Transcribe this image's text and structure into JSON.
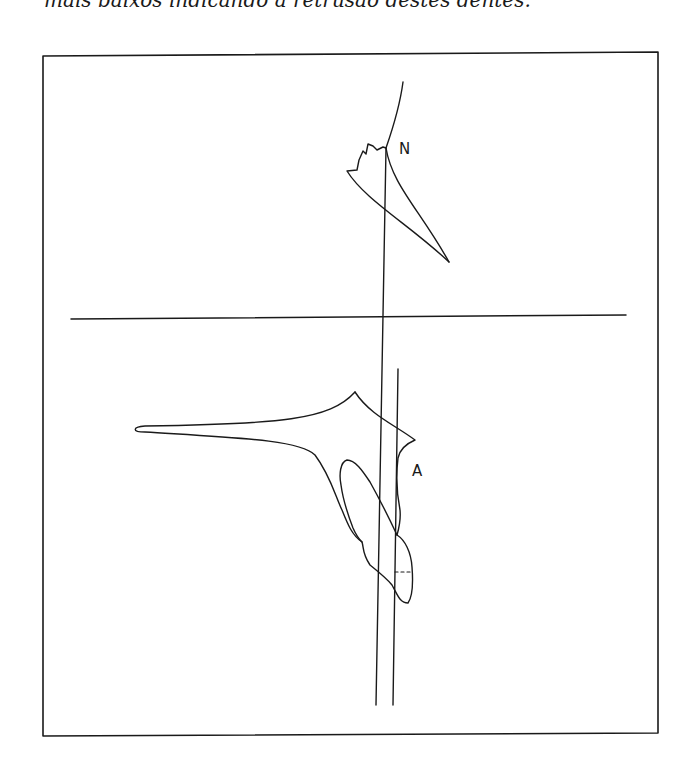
{
  "caption": "mais baixos indicando a retrusão destes dentes.",
  "figure": {
    "labels": {
      "n": "N",
      "a": "A"
    },
    "colors": {
      "stroke": "#1a1a1a",
      "background": "#ffffff"
    }
  }
}
